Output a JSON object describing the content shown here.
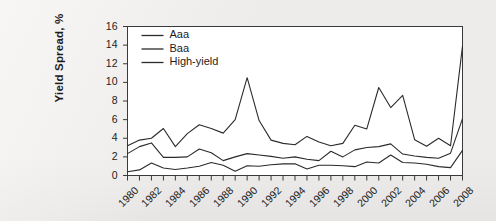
{
  "chart_data": {
    "type": "line",
    "title": "",
    "xlabel": "",
    "ylabel": "Yield Spread, %",
    "xlim": [
      1980,
      2008
    ],
    "ylim": [
      0,
      16
    ],
    "ytick_step": 2,
    "grid": false,
    "legend_position": "top-left",
    "x": [
      1980,
      1981,
      1982,
      1983,
      1984,
      1985,
      1986,
      1987,
      1988,
      1989,
      1990,
      1991,
      1992,
      1993,
      1994,
      1995,
      1996,
      1997,
      1998,
      1999,
      2000,
      2001,
      2002,
      2003,
      2004,
      2005,
      2006,
      2007,
      2008
    ],
    "yticks": [
      0,
      2,
      4,
      6,
      8,
      10,
      12,
      14,
      16
    ],
    "xticks": [
      1980,
      1982,
      1984,
      1986,
      1988,
      1990,
      1992,
      1994,
      1996,
      1998,
      2000,
      2002,
      2004,
      2006,
      2008
    ],
    "xtick_labels": [
      "1980",
      "1982",
      "1984",
      "1986",
      "1988",
      "1990",
      "1992",
      "1994",
      "1996",
      "1998",
      "2000",
      "2002",
      "2004",
      "2006",
      "2008"
    ],
    "ytick_labels": [
      "0",
      "2",
      "4",
      "6",
      "8",
      "10",
      "12",
      "14",
      "16"
    ],
    "series": [
      {
        "name": "Aaa",
        "color": "#2b2b2b",
        "values": [
          0.4,
          0.6,
          1.35,
          0.8,
          0.65,
          0.8,
          1.0,
          1.4,
          1.1,
          0.45,
          1.05,
          1.0,
          1.15,
          1.25,
          1.25,
          0.7,
          1.1,
          1.1,
          1.05,
          0.95,
          1.45,
          1.35,
          2.2,
          1.4,
          1.35,
          1.2,
          0.95,
          0.85,
          2.7
        ]
      },
      {
        "name": "Baa",
        "color": "#2b2b2b",
        "values": [
          2.35,
          3.1,
          3.5,
          1.95,
          1.95,
          2.0,
          2.85,
          2.45,
          1.6,
          2.0,
          2.35,
          2.2,
          2.05,
          1.85,
          2.0,
          1.75,
          1.6,
          2.6,
          2.0,
          2.75,
          3.0,
          3.1,
          3.4,
          2.3,
          2.1,
          1.95,
          1.85,
          2.4,
          6.1
        ]
      },
      {
        "name": "High-yield",
        "color": "#2b2b2b",
        "values": [
          3.2,
          3.8,
          4.0,
          5.05,
          3.1,
          4.5,
          5.45,
          5.05,
          4.55,
          6.0,
          10.5,
          5.9,
          3.8,
          3.45,
          3.3,
          4.2,
          3.6,
          3.2,
          3.45,
          5.4,
          5.0,
          9.45,
          7.3,
          8.6,
          3.85,
          3.15,
          4.0,
          3.2,
          13.9
        ]
      }
    ]
  },
  "legend": {
    "entries": [
      "Aaa",
      "Baa",
      "High-yield"
    ]
  },
  "axes": {
    "y_title": "Yield Spread, %"
  }
}
